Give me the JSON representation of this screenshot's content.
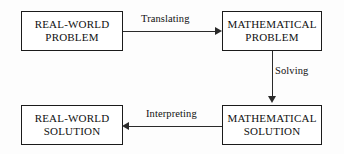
{
  "diagram": {
    "type": "flowchart",
    "nodes": [
      {
        "id": "real-world-problem",
        "line1": "REAL-WORLD",
        "line2": "PROBLEM"
      },
      {
        "id": "mathematical-problem",
        "line1": "MATHEMATICAL",
        "line2": "PROBLEM"
      },
      {
        "id": "mathematical-solution",
        "line1": "MATHEMATICAL",
        "line2": "SOLUTION"
      },
      {
        "id": "real-world-solution",
        "line1": "REAL-WORLD",
        "line2": "SOLUTION"
      }
    ],
    "edges": [
      {
        "id": "translating",
        "label": "Translating",
        "from": "real-world-problem",
        "to": "mathematical-problem",
        "direction": "right"
      },
      {
        "id": "solving",
        "label": "Solving",
        "from": "mathematical-problem",
        "to": "mathematical-solution",
        "direction": "down"
      },
      {
        "id": "interpreting",
        "label": "Interpreting",
        "from": "mathematical-solution",
        "to": "real-world-solution",
        "direction": "left"
      }
    ],
    "colors": {
      "background": "#fdfdfd",
      "box_border": "#1b1b1b",
      "line": "#2a2a2a",
      "text": "#101010"
    }
  }
}
